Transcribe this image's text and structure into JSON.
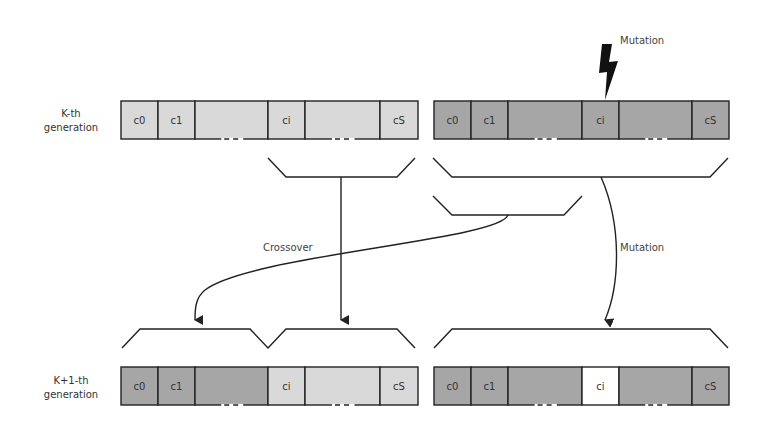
{
  "colors": {
    "light": "#d9d9d9",
    "dark": "#a6a6a6",
    "mutated": "#ffffff",
    "stroke": "#222222"
  },
  "generations": [
    {
      "label_line1": "K-th",
      "label_line2": "generation"
    },
    {
      "label_line1": "K+1-th",
      "label_line2": "generation"
    }
  ],
  "chromosomes": {
    "parent_a": {
      "cells": [
        {
          "label": "c0",
          "shade": "light"
        },
        {
          "label": "c1",
          "shade": "light"
        },
        {
          "label": "",
          "shade": "light",
          "ellipsis": true
        },
        {
          "label": "ci",
          "shade": "light"
        },
        {
          "label": "",
          "shade": "light",
          "ellipsis": true
        },
        {
          "label": "cS",
          "shade": "light"
        }
      ]
    },
    "parent_b": {
      "cells": [
        {
          "label": "c0",
          "shade": "dark"
        },
        {
          "label": "c1",
          "shade": "dark"
        },
        {
          "label": "",
          "shade": "dark",
          "ellipsis": true
        },
        {
          "label": "ci",
          "shade": "dark"
        },
        {
          "label": "",
          "shade": "dark",
          "ellipsis": true
        },
        {
          "label": "cS",
          "shade": "dark"
        }
      ]
    },
    "child_crossover": {
      "cells": [
        {
          "label": "c0",
          "shade": "dark"
        },
        {
          "label": "c1",
          "shade": "dark"
        },
        {
          "label": "",
          "shade": "dark",
          "ellipsis": true
        },
        {
          "label": "ci",
          "shade": "light"
        },
        {
          "label": "",
          "shade": "light",
          "ellipsis": true
        },
        {
          "label": "cS",
          "shade": "light"
        }
      ]
    },
    "child_mutation": {
      "cells": [
        {
          "label": "c0",
          "shade": "dark"
        },
        {
          "label": "c1",
          "shade": "dark"
        },
        {
          "label": "",
          "shade": "dark",
          "ellipsis": true
        },
        {
          "label": "ci",
          "shade": "mutated"
        },
        {
          "label": "",
          "shade": "dark",
          "ellipsis": true
        },
        {
          "label": "cS",
          "shade": "dark"
        }
      ]
    }
  },
  "operations": {
    "crossover_label": "Crossover",
    "mutation_label": "Mutation",
    "mutation_event_label": "Mutation"
  },
  "icons": {
    "mutation_event": "lightning-bolt-icon"
  }
}
